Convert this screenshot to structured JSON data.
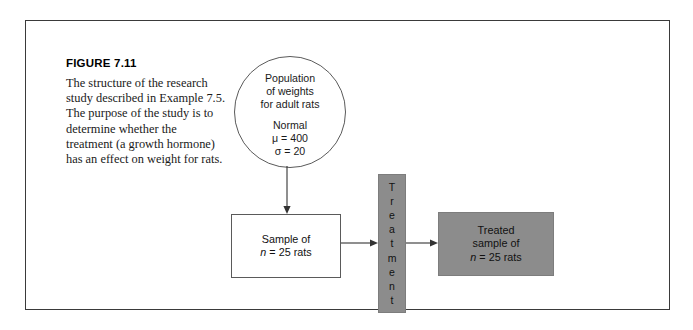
{
  "figure": {
    "number": "FIGURE 7.11",
    "caption": "The structure of the research study described in Example 7.5. The purpose of the study is to determine whether the treatment (a growth hormone) has an effect on weight for rats."
  },
  "diagram": {
    "population": {
      "line1": "Population",
      "line2": "of weights",
      "line3": "for adult rats",
      "distribution": "Normal",
      "mean": "μ = 400",
      "sd": "σ = 20"
    },
    "sample": {
      "line1": "Sample of",
      "line2_n": "n",
      "line2_rest": " = 25 rats"
    },
    "treatment": {
      "label": "Treatment",
      "letters": [
        "T",
        "r",
        "e",
        "a",
        "t",
        "m",
        "e",
        "n",
        "t"
      ]
    },
    "treated_sample": {
      "line1": "Treated",
      "line2": "sample of",
      "line3_n": "n",
      "line3_rest": " = 25 rats"
    }
  },
  "colors": {
    "frame_border": "#3a3a3a",
    "shape_outline": "#5a5a5a",
    "gray_fill": "#8c8c8c",
    "text": "#1a1a1a",
    "arrow": "#333333"
  }
}
